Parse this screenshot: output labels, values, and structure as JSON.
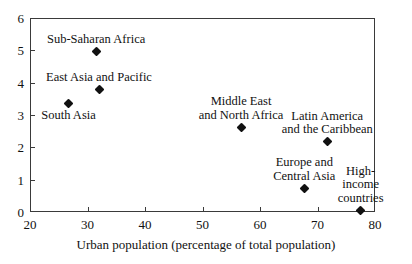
{
  "chart_data": {
    "type": "scatter",
    "title": "",
    "xlabel": "Urban population (percentage of total population)",
    "ylabel": "",
    "xlim": [
      20,
      80
    ],
    "ylim": [
      0,
      6
    ],
    "xticks": [
      20,
      30,
      40,
      50,
      60,
      70,
      80
    ],
    "yticks": [
      0,
      1,
      2,
      3,
      4,
      5,
      6
    ],
    "grid": false,
    "legend": "none",
    "points": [
      {
        "label": "Sub-Saharan Africa",
        "x": 31.5,
        "y": 4.95,
        "label_lines": [
          "Sub-Saharan Africa"
        ],
        "label_position": "above"
      },
      {
        "label": "East Asia and Pacific",
        "x": 32.0,
        "y": 3.78,
        "label_lines": [
          "East Asia and Pacific"
        ],
        "label_position": "above"
      },
      {
        "label": "South Asia",
        "x": 26.7,
        "y": 3.35,
        "label_lines": [
          "South Asia"
        ],
        "label_position": "below"
      },
      {
        "label": "Middle East and North Africa",
        "x": 56.7,
        "y": 2.62,
        "label_lines": [
          "Middle East",
          "and North Africa"
        ],
        "label_position": "above"
      },
      {
        "label": "Latin America and the Caribbean",
        "x": 71.7,
        "y": 2.17,
        "label_lines": [
          "Latin America",
          "and the Caribbean"
        ],
        "label_position": "above"
      },
      {
        "label": "Europe and Central Asia",
        "x": 67.7,
        "y": 0.73,
        "label_lines": [
          "Europe and",
          "Central Asia"
        ],
        "label_position": "above"
      },
      {
        "label": "High-income countries",
        "x": 77.5,
        "y": 0.05,
        "label_lines": [
          "High-",
          "income",
          "countries"
        ],
        "label_position": "above"
      }
    ]
  },
  "axis": {
    "xtick_labels": [
      "20",
      "30",
      "40",
      "50",
      "60",
      "70",
      "80"
    ],
    "ytick_labels": [
      "0",
      "1",
      "2",
      "3",
      "4",
      "5",
      "6"
    ],
    "xlabel": "Urban population (percentage of total population)"
  },
  "colors": {
    "marker": "#111111",
    "axis": "#3a3a3a",
    "text": "#111111",
    "background": "#ffffff"
  }
}
